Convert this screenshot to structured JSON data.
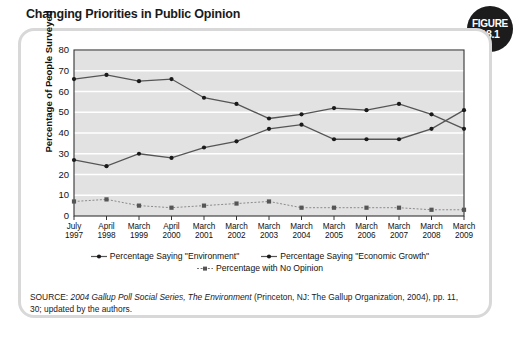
{
  "figure": {
    "title": "Changing Priorities in Public Opinion",
    "badge_word": "FIGURE",
    "badge_number": "18.1"
  },
  "source_note": {
    "prefix": "SOURCE: ",
    "italic_title": "2004 Gallup Poll Social Series, The Environment",
    "rest": " (Princeton, NJ: The Gallup Organization, 2004), pp. 11, 30; updated by the authors."
  },
  "colors": {
    "plot_background": "#e2e2e2",
    "gridline": "#ffffff",
    "axis": "#333333",
    "series_line": "#555555",
    "series_marker": "#1a1a1a",
    "badge_background": "#1c1c1c",
    "frame_border": "#d8d8d8"
  },
  "chart_data": {
    "type": "line",
    "title": "Changing Priorities in Public Opinion",
    "xlabel": "",
    "ylabel": "Percentage of People Surveyed",
    "ylim": [
      0,
      80
    ],
    "yticks": [
      0,
      10,
      20,
      30,
      40,
      50,
      60,
      70,
      80
    ],
    "grid": true,
    "legend_position": "bottom",
    "categories": [
      "July 1997",
      "April 1998",
      "March 1999",
      "April 2000",
      "March 2001",
      "March 2002",
      "March 2003",
      "March 2004",
      "March 2005",
      "March 2006",
      "March 2007",
      "March 2008",
      "March 2009"
    ],
    "category_lines": [
      [
        "July",
        "1997"
      ],
      [
        "April",
        "1998"
      ],
      [
        "March",
        "1999"
      ],
      [
        "April",
        "2000"
      ],
      [
        "March",
        "2001"
      ],
      [
        "March",
        "2002"
      ],
      [
        "March",
        "2003"
      ],
      [
        "March",
        "2004"
      ],
      [
        "March",
        "2005"
      ],
      [
        "March",
        "2006"
      ],
      [
        "March",
        "2007"
      ],
      [
        "March",
        "2008"
      ],
      [
        "March",
        "2009"
      ]
    ],
    "series": [
      {
        "name": "Percentage Saying \"Environment\"",
        "marker": "circle",
        "dash": false,
        "values": [
          66,
          68,
          65,
          66,
          57,
          54,
          47,
          49,
          52,
          51,
          54,
          49,
          42
        ]
      },
      {
        "name": "Percentage Saying \"Economic Growth\"",
        "marker": "circle",
        "dash": false,
        "values": [
          27,
          24,
          30,
          28,
          33,
          36,
          42,
          44,
          37,
          37,
          37,
          42,
          51
        ]
      },
      {
        "name": "Percentage with No Opinion",
        "marker": "square",
        "dash": true,
        "values": [
          7,
          8,
          5,
          4,
          5,
          6,
          7,
          4,
          4,
          4,
          4,
          3,
          3
        ]
      }
    ]
  }
}
